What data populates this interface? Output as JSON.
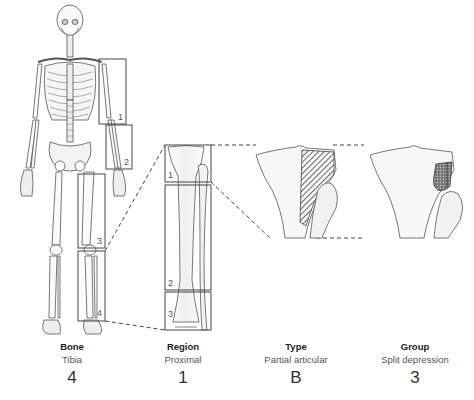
{
  "diagram": {
    "skeleton_boxes": [
      {
        "num": "1",
        "name": "humerus-region"
      },
      {
        "num": "2",
        "name": "radius-ulna-region"
      },
      {
        "num": "3",
        "name": "femur-region"
      },
      {
        "num": "4",
        "name": "tibia-fibula-region"
      }
    ],
    "tibia_segments": [
      {
        "num": "1",
        "name": "proximal"
      },
      {
        "num": "2",
        "name": "diaphysis"
      },
      {
        "num": "3",
        "name": "distal"
      }
    ],
    "detail_views": [
      {
        "name": "partial-articular-split",
        "pattern": "hatched"
      },
      {
        "name": "split-depression",
        "pattern": "stippled"
      }
    ]
  },
  "labels": [
    {
      "title": "Bone",
      "value": "Tibia",
      "code": "4"
    },
    {
      "title": "Region",
      "value": "Proximal",
      "code": "1"
    },
    {
      "title": "Type",
      "value": "Partial articular",
      "code": "B"
    },
    {
      "title": "Group",
      "value": "Split depression",
      "code": "3"
    }
  ],
  "colors": {
    "line": "#555555",
    "box": "#444444",
    "bone_fill": "#f4f4f4"
  }
}
